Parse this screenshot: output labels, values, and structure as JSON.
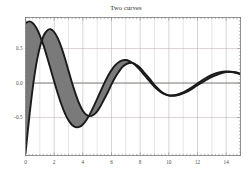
{
  "figure": {
    "title": "Two curves",
    "background": "#ffffff",
    "frame_color": "#8a8a8a",
    "grid_color": "#b9a7a7",
    "axis_line_color": "#8a8a8a",
    "curve_color": "#1a1a1a",
    "fill_color": "#7a7a7a"
  },
  "chart_data": {
    "type": "line",
    "title": "Two curves",
    "xlabel": "",
    "ylabel": "",
    "xlim": [
      0,
      15
    ],
    "ylim": [
      -1.05,
      0.95
    ],
    "grid": true,
    "legend": false,
    "xticks": [
      0,
      2,
      4,
      6,
      8,
      10,
      12,
      14
    ],
    "xtick_labels": [
      "0",
      "2",
      "4",
      "6",
      "8",
      "10",
      "12",
      "14"
    ],
    "yticks": [
      -0.5,
      0.0,
      0.5
    ],
    "ytick_labels": [
      "-0.5",
      "0.0",
      "0.5"
    ],
    "fill_between": true,
    "fill_label": "shaded region between curves",
    "series": [
      {
        "name": "curve-a",
        "formula": "exp(-x/5) * sin(x + 1.05)",
        "x": [
          0.0,
          0.25,
          0.5,
          0.75,
          1.0,
          1.25,
          1.5,
          1.75,
          2.0,
          2.25,
          2.5,
          2.75,
          3.0,
          3.25,
          3.5,
          3.75,
          4.0,
          4.25,
          4.5,
          4.75,
          5.0,
          5.25,
          5.5,
          5.75,
          6.0,
          6.25,
          6.5,
          6.75,
          7.0,
          7.25,
          7.5,
          7.75,
          8.0,
          8.25,
          8.5,
          8.75,
          9.0,
          9.25,
          9.5,
          9.75,
          10.0,
          10.5,
          11.0,
          11.5,
          12.0,
          12.5,
          13.0,
          13.5,
          14.0,
          14.5,
          15.0
        ],
        "y": [
          0.867,
          0.894,
          0.871,
          0.802,
          0.692,
          0.549,
          0.382,
          0.203,
          0.022,
          -0.151,
          -0.307,
          -0.439,
          -0.54,
          -0.608,
          -0.639,
          -0.636,
          -0.6,
          -0.535,
          -0.447,
          -0.342,
          -0.228,
          -0.112,
          -0.001,
          0.101,
          0.187,
          0.255,
          0.302,
          0.328,
          0.333,
          0.318,
          0.287,
          0.242,
          0.187,
          0.126,
          0.064,
          0.003,
          -0.053,
          -0.101,
          -0.139,
          -0.165,
          -0.179,
          -0.173,
          -0.136,
          -0.077,
          -0.007,
          0.062,
          0.119,
          0.155,
          0.168,
          0.157,
          0.126
        ]
      },
      {
        "name": "curve-b",
        "formula": "exp(-x/5) * sin(x) * 1.9 - 0.95",
        "x": [
          0.0,
          0.25,
          0.5,
          0.75,
          1.0,
          1.25,
          1.5,
          1.75,
          2.0,
          2.25,
          2.5,
          2.75,
          3.0,
          3.25,
          3.5,
          3.75,
          4.0,
          4.25,
          4.5,
          4.75,
          5.0,
          5.25,
          5.5,
          5.75,
          6.0,
          6.25,
          6.5,
          6.75,
          7.0,
          7.25,
          7.5,
          7.75,
          8.0,
          8.25,
          8.5,
          8.75,
          9.0,
          9.25,
          9.5,
          9.75,
          10.0,
          10.5,
          11.0,
          11.5,
          12.0,
          12.5,
          13.0,
          13.5,
          14.0,
          14.5,
          15.0
        ],
        "y": [
          -1.02,
          -0.52,
          -0.08,
          0.27,
          0.52,
          0.68,
          0.76,
          0.78,
          0.74,
          0.65,
          0.52,
          0.36,
          0.18,
          0.0,
          -0.16,
          -0.3,
          -0.4,
          -0.46,
          -0.48,
          -0.46,
          -0.41,
          -0.33,
          -0.23,
          -0.13,
          -0.02,
          0.08,
          0.16,
          0.23,
          0.27,
          0.29,
          0.29,
          0.26,
          0.22,
          0.16,
          0.1,
          0.04,
          -0.03,
          -0.08,
          -0.13,
          -0.16,
          -0.18,
          -0.18,
          -0.15,
          -0.1,
          -0.03,
          0.03,
          0.09,
          0.13,
          0.16,
          0.16,
          0.14
        ]
      }
    ]
  }
}
